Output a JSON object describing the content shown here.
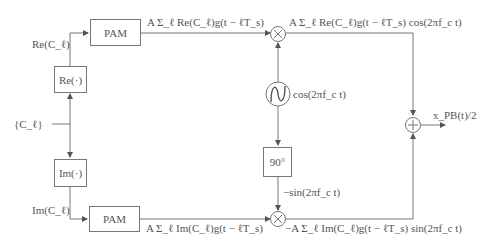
{
  "diagram": {
    "input": {
      "label": "{C_ℓ}"
    },
    "blocks": {
      "re": {
        "label": "Re(·)"
      },
      "im": {
        "label": "Im(·)"
      },
      "pam_top": {
        "label": "PAM"
      },
      "pam_bottom": {
        "label": "PAM"
      },
      "oscillator": {
        "label": "cos(2πf_c t)",
        "icon": "sine-oscillator-icon"
      },
      "phase_shift": {
        "label": "90°"
      },
      "mult_top": {
        "icon": "multiplier-icon",
        "symbol": "×"
      },
      "mult_bottom": {
        "icon": "multiplier-icon",
        "symbol": "×"
      },
      "adder": {
        "icon": "adder-icon",
        "symbol": "+"
      }
    },
    "signals": {
      "re_c": "Re(C_ℓ)",
      "im_c": "Im(C_ℓ)",
      "pam_top_out": "A Σ_ℓ Re(C_ℓ)g(t − ℓT_s)",
      "pam_bottom_out": "A Σ_ℓ Im(C_ℓ)g(t − ℓT_s)",
      "mult_top_out": "A Σ_ℓ Re(C_ℓ)g(t − ℓT_s) cos(2πf_c t)",
      "mult_bottom_out": "−A Σ_ℓ Im(C_ℓ)g(t − ℓT_s) sin(2πf_c t)",
      "neg_sin": "−sin(2πf_c t)",
      "output": "x_PB(t)/2"
    },
    "colors": {
      "line": "#777777",
      "text": "#555555",
      "background": "#ffffff"
    }
  }
}
